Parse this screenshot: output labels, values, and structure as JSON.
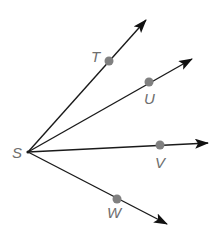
{
  "diagram": {
    "type": "rays-from-common-endpoint",
    "vertex": {
      "label": "S",
      "x": 28,
      "y": 152,
      "label_x": 12,
      "label_y": 158
    },
    "rays": [
      {
        "name": "ray-ST",
        "point_label": "T",
        "point": {
          "x": 109,
          "y": 61
        },
        "tip": {
          "x": 146,
          "y": 20
        },
        "label_x": 91,
        "label_y": 62
      },
      {
        "name": "ray-SU",
        "point_label": "U",
        "point": {
          "x": 149,
          "y": 82
        },
        "tip": {
          "x": 192,
          "y": 59
        },
        "label_x": 144,
        "label_y": 104
      },
      {
        "name": "ray-SV",
        "point_label": "V",
        "point": {
          "x": 160,
          "y": 145
        },
        "tip": {
          "x": 208,
          "y": 143
        },
        "label_x": 155,
        "label_y": 168
      },
      {
        "name": "ray-SW",
        "point_label": "W",
        "point": {
          "x": 117,
          "y": 199
        },
        "tip": {
          "x": 167,
          "y": 224
        },
        "label_x": 107,
        "label_y": 218
      }
    ],
    "colors": {
      "line": "#1a1a1a",
      "point": "#808080",
      "label": "#6e6e6e"
    }
  }
}
